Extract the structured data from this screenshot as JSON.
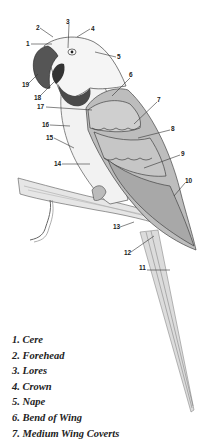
{
  "diagram": {
    "colors": {
      "background": "#ffffff",
      "ink": "#222222",
      "plumage": "#c9c9c9",
      "shadow": "#8a8a8a"
    },
    "callouts": [
      {
        "n": "1",
        "x": 26,
        "y": 41
      },
      {
        "n": "2",
        "x": 36,
        "y": 25
      },
      {
        "n": "3",
        "x": 66,
        "y": 19
      },
      {
        "n": "4",
        "x": 91,
        "y": 26
      },
      {
        "n": "5",
        "x": 117,
        "y": 54
      },
      {
        "n": "6",
        "x": 129,
        "y": 72
      },
      {
        "n": "7",
        "x": 157,
        "y": 97
      },
      {
        "n": "8",
        "x": 171,
        "y": 126
      },
      {
        "n": "9",
        "x": 181,
        "y": 151
      },
      {
        "n": "10",
        "x": 185,
        "y": 178
      },
      {
        "n": "11",
        "x": 139,
        "y": 265
      },
      {
        "n": "12",
        "x": 124,
        "y": 250
      },
      {
        "n": "13",
        "x": 113,
        "y": 224
      },
      {
        "n": "14",
        "x": 54,
        "y": 161
      },
      {
        "n": "15",
        "x": 46,
        "y": 135
      },
      {
        "n": "16",
        "x": 42,
        "y": 122
      },
      {
        "n": "17",
        "x": 37,
        "y": 104
      },
      {
        "n": "18",
        "x": 34,
        "y": 95
      },
      {
        "n": "19",
        "x": 22,
        "y": 82
      }
    ]
  },
  "legend": [
    "1. Cere",
    "2. Forehead",
    "3. Lores",
    "4. Crown",
    "5. Nape",
    "6. Bend of Wing",
    "7. Medium Wing Coverts"
  ]
}
